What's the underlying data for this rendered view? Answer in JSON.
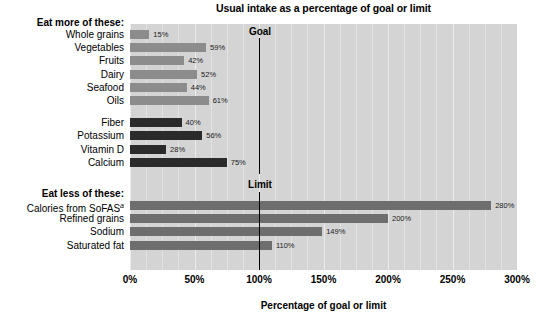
{
  "chart_data": {
    "type": "bar",
    "orientation": "horizontal",
    "title": "Usual intake as a percentage of goal or limit",
    "xlabel": "Percentage of goal or limit",
    "ylabel": "",
    "xlim": [
      0,
      300
    ],
    "xticks": [
      "0%",
      "50%",
      "100%",
      "150%",
      "200%",
      "250%",
      "300%"
    ],
    "xtick_values": [
      0,
      50,
      100,
      150,
      200,
      250,
      300
    ],
    "grid": true,
    "legend": "none",
    "groups": [
      {
        "heading": "Eat more of these:",
        "series_name": "Food groups",
        "color": "#8c8c8c",
        "categories": [
          "Whole grains",
          "Vegetables",
          "Fruits",
          "Dairy",
          "Seafood",
          "Oils"
        ],
        "values": [
          15,
          59,
          42,
          52,
          44,
          61
        ],
        "labels": [
          "15%",
          "59%",
          "42%",
          "52%",
          "44%",
          "61%"
        ]
      },
      {
        "heading": "",
        "series_name": "Nutrients to increase",
        "color": "#2b2b2b",
        "categories": [
          "Fiber",
          "Potassium",
          "Vitamin D",
          "Calcium"
        ],
        "values": [
          40,
          56,
          28,
          75
        ],
        "labels": [
          "40%",
          "56%",
          "28%",
          "75%"
        ]
      },
      {
        "heading": "Eat less of these:",
        "series_name": "Components to reduce",
        "color": "#6e6e6e",
        "categories": [
          "Calories from SoFAS",
          "Refined grains",
          "Sodium",
          "Saturated fat"
        ],
        "category_superscripts": [
          "a",
          "",
          "",
          ""
        ],
        "values": [
          280,
          200,
          149,
          110
        ],
        "labels": [
          "280%",
          "200%",
          "149%",
          "110%"
        ]
      }
    ],
    "annotations": [
      {
        "label": "Goal",
        "x": 100,
        "kind": "reference-line"
      },
      {
        "label": "Limit",
        "x": 100,
        "kind": "reference-line"
      }
    ],
    "colors": {
      "plot_background": "#d4d4d4",
      "gridline": "#ececec",
      "food_group_bar": "#8c8c8c",
      "nutrient_bar": "#2b2b2b",
      "reduce_bar": "#6e6e6e",
      "reference_line": "#000000",
      "text": "#000000"
    }
  }
}
